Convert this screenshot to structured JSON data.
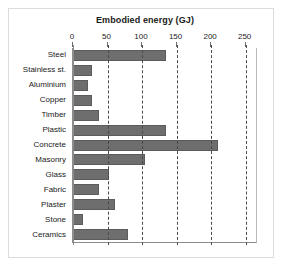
{
  "chart_data": {
    "type": "bar",
    "orientation": "horizontal",
    "title": "Embodied energy (GJ)",
    "xlabel": "",
    "ylabel": "",
    "xlim": [
      0,
      265
    ],
    "xticks": [
      0,
      50,
      100,
      150,
      200,
      250
    ],
    "xtick_labels": [
      "0",
      "50",
      "100",
      "150",
      "200",
      "250"
    ],
    "grid": "vertical-dashed",
    "legend": "none",
    "bar_color": "#6e6e6e",
    "categories": [
      "Steel",
      "Stainless st.",
      "Aluminium",
      "Copper",
      "Timber",
      "Plastic",
      "Concrete",
      "Masonry",
      "Glass",
      "Fabric",
      "Plaster",
      "Stone",
      "Ceramics"
    ],
    "values": [
      135,
      28,
      22,
      27,
      37,
      135,
      210,
      104,
      52,
      37,
      61,
      14,
      80
    ],
    "units": "GJ"
  }
}
